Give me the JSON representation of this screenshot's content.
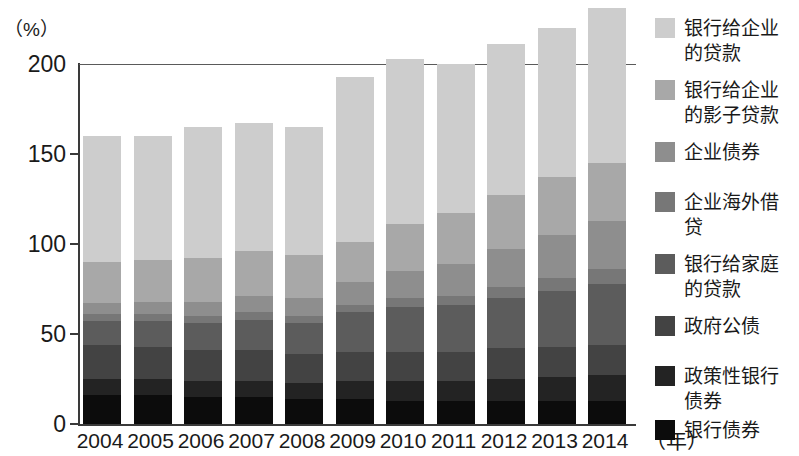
{
  "axis": {
    "unit_label": "（%）",
    "y_ticks": [
      "200",
      "150",
      "100",
      "50",
      "0"
    ],
    "y_tick_values": [
      200,
      150,
      100,
      50,
      0
    ],
    "x_unit_label": "（年）"
  },
  "legend": {
    "items": [
      {
        "label": "银行给企业\n的贷款",
        "color": "#cdcdcd",
        "key": "bank-loans-to-enterprises"
      },
      {
        "label": "银行给企业\n的影子贷款",
        "color": "#a8a8a8",
        "key": "shadow-loans-to-enterprises"
      },
      {
        "label": "企业债券",
        "color": "#8e8e8e",
        "key": "corporate-bonds"
      },
      {
        "label": "企业海外借\n贷",
        "color": "#777777",
        "key": "overseas-borrowing"
      },
      {
        "label": "银行给家庭\n的贷款",
        "color": "#5c5c5c",
        "key": "bank-loans-to-households"
      },
      {
        "label": "政府公债",
        "color": "#434343",
        "key": "government-bonds"
      },
      {
        "label": "政策性银行\n债券",
        "color": "#232323",
        "key": "policy-bank-bonds"
      },
      {
        "label": "银行债券",
        "color": "#0c0c0c",
        "key": "bank-bonds"
      }
    ]
  },
  "chart_data": {
    "type": "bar",
    "stacked": true,
    "title": "",
    "xlabel": "（年）",
    "ylabel": "（%）",
    "ylim": [
      0,
      215
    ],
    "grid": "single gridline at 200",
    "categories": [
      "2004",
      "2005",
      "2006",
      "2007",
      "2008",
      "2009",
      "2010",
      "2011",
      "2012",
      "2013",
      "2014"
    ],
    "series": [
      {
        "name": "银行债券",
        "color": "#0c0c0c",
        "values": [
          16,
          16,
          15,
          15,
          14,
          14,
          13,
          13,
          13,
          13,
          13
        ]
      },
      {
        "name": "政策性银行债券",
        "color": "#232323",
        "values": [
          9,
          9,
          9,
          9,
          9,
          10,
          11,
          11,
          12,
          13,
          14
        ]
      },
      {
        "name": "政府公债",
        "color": "#434343",
        "values": [
          19,
          18,
          17,
          17,
          16,
          16,
          16,
          16,
          17,
          17,
          17
        ]
      },
      {
        "name": "银行给家庭的贷款",
        "color": "#5c5c5c",
        "values": [
          13,
          14,
          15,
          17,
          17,
          22,
          25,
          26,
          28,
          31,
          34
        ]
      },
      {
        "name": "企业海外借贷",
        "color": "#777777",
        "values": [
          4,
          4,
          4,
          4,
          4,
          4,
          5,
          5,
          6,
          7,
          8
        ]
      },
      {
        "name": "企业债券",
        "color": "#8e8e8e",
        "values": [
          6,
          7,
          8,
          9,
          10,
          13,
          15,
          18,
          21,
          24,
          27
        ]
      },
      {
        "name": "银行给企业的影子贷款",
        "color": "#a8a8a8",
        "values": [
          23,
          23,
          24,
          25,
          24,
          22,
          26,
          28,
          30,
          32,
          32
        ]
      },
      {
        "name": "银行给企业的贷款",
        "color": "#cdcdcd",
        "values": [
          70,
          69,
          73,
          71,
          71,
          92,
          92,
          83,
          84,
          83,
          86
        ]
      }
    ],
    "totals": [
      160,
      160,
      165,
      167,
      165,
      193,
      203,
      200,
      211,
      220,
      231
    ]
  }
}
